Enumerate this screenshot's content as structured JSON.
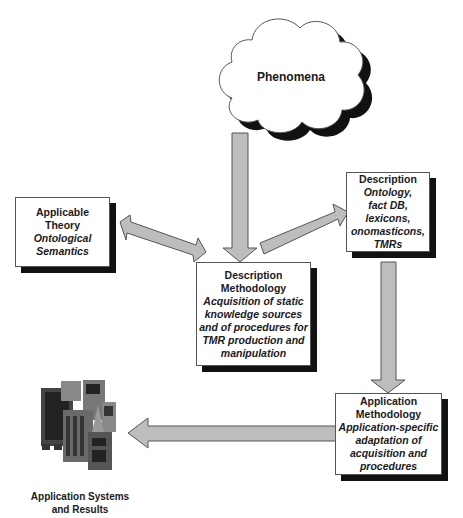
{
  "diagram": {
    "cloud": {
      "label": "Phenomena"
    },
    "boxes": {
      "theory": {
        "title": "Applicable Theory",
        "title_lines": [
          "Applicable",
          "Theory"
        ],
        "subtitle_lines": [
          "Ontological",
          "Semantics"
        ]
      },
      "desc_method": {
        "title_lines": [
          "Description",
          "Methodology"
        ],
        "subtitle_lines": [
          "Acquisition of static",
          "knowledge sources",
          "and of procedures for",
          "TMR production and",
          "manipulation"
        ]
      },
      "description": {
        "title_lines": [
          "Description"
        ],
        "subtitle_lines": [
          "Ontology,",
          "fact DB,",
          "lexicons,",
          "onomasticons,",
          "TMRs"
        ]
      },
      "app_method": {
        "title_lines": [
          "Application",
          "Methodology"
        ],
        "subtitle_lines": [
          "Application-specific",
          "adaptation of",
          "acquisition and",
          "procedures"
        ]
      }
    },
    "buildings": {
      "caption_lines": [
        "Application Systems",
        "and Results"
      ]
    },
    "arrows": [
      {
        "from": "Phenomena",
        "to": "Description Methodology",
        "type": "single"
      },
      {
        "from": "Applicable Theory",
        "to": "Description Methodology",
        "type": "double"
      },
      {
        "from": "Description Methodology",
        "to": "Description",
        "type": "single"
      },
      {
        "from": "Description",
        "to": "Application Methodology",
        "type": "single"
      },
      {
        "from": "Application Methodology",
        "to": "Application Systems and Results",
        "type": "single"
      }
    ],
    "colors": {
      "arrow_fill": "#bdbdbd",
      "arrow_stroke": "#555555",
      "shadow": "#111111",
      "box_border": "#555555"
    }
  }
}
